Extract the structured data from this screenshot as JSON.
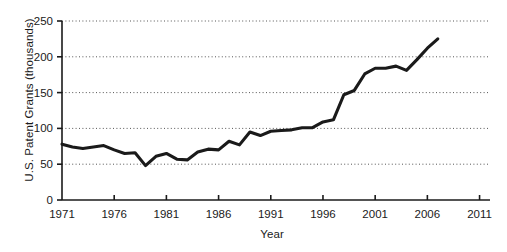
{
  "chart_data": {
    "type": "line",
    "title": "",
    "xlabel": "Year",
    "ylabel": "U.S. Patent Grants (thousands)",
    "xlim": [
      1971,
      2012
    ],
    "ylim": [
      0,
      250
    ],
    "grid": "horizontal-dotted",
    "legend": "none",
    "line_color": "#1a1a1a",
    "xticks": [
      1971,
      1976,
      1981,
      1986,
      1991,
      1996,
      2001,
      2006,
      2011
    ],
    "xtick_labels": [
      "1971",
      "1976",
      "1981",
      "1986",
      "1991",
      "1996",
      "2001",
      "2006",
      "2011"
    ],
    "yticks": [
      0,
      50,
      100,
      150,
      200,
      250
    ],
    "ytick_labels": [
      "0",
      "50",
      "100",
      "150",
      "200",
      "250"
    ],
    "x": [
      1971,
      1972,
      1973,
      1974,
      1975,
      1976,
      1977,
      1978,
      1979,
      1980,
      1981,
      1982,
      1983,
      1984,
      1985,
      1986,
      1987,
      1988,
      1989,
      1990,
      1991,
      1992,
      1993,
      1994,
      1995,
      1996,
      1997,
      1998,
      1999,
      2000,
      2001,
      2002,
      2003,
      2004,
      2005,
      2006,
      2007
    ],
    "values": [
      78,
      74,
      72,
      74,
      76,
      70,
      65,
      66,
      48,
      61,
      65,
      57,
      56,
      67,
      71,
      70,
      82,
      77,
      95,
      90,
      96,
      97,
      98,
      101,
      101,
      109,
      112,
      147,
      153,
      176,
      184,
      184,
      187,
      181,
      196,
      212,
      225
    ],
    "series": [
      {
        "name": "U.S. Patent Grants",
        "values": [
          78,
          74,
          72,
          74,
          76,
          70,
          65,
          66,
          48,
          61,
          65,
          57,
          56,
          67,
          71,
          70,
          82,
          77,
          95,
          90,
          96,
          97,
          98,
          101,
          101,
          109,
          112,
          147,
          153,
          176,
          184,
          184,
          187,
          181,
          196,
          212,
          225
        ]
      }
    ]
  },
  "axes": {
    "y_title": "U.S. Patent Grants (thousands)",
    "x_title": "Year"
  }
}
